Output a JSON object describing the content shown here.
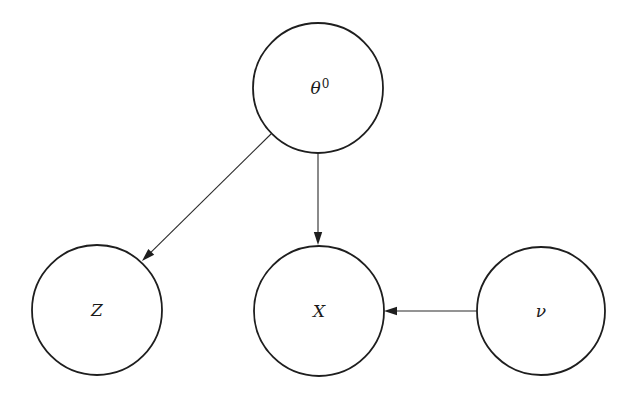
{
  "diagram": {
    "type": "directed-graph",
    "width": 635,
    "height": 398,
    "colors": {
      "background": "#ffffff",
      "stroke": "#1e1e1e",
      "text": "#1a1a1a"
    },
    "nodes": [
      {
        "id": "theta0",
        "label": "θ",
        "superscript": "0",
        "cx": 318,
        "cy": 88,
        "r": 65
      },
      {
        "id": "Z",
        "label": "Z",
        "superscript": "",
        "cx": 97,
        "cy": 310,
        "r": 65
      },
      {
        "id": "X",
        "label": "X",
        "superscript": "",
        "cx": 319,
        "cy": 311,
        "r": 65
      },
      {
        "id": "nu",
        "label": "ν",
        "superscript": "",
        "cx": 541,
        "cy": 311,
        "r": 64
      }
    ],
    "edges": [
      {
        "from": "theta0",
        "to": "Z",
        "x1": 271,
        "y1": 134,
        "x2": 142,
        "y2": 261
      },
      {
        "from": "theta0",
        "to": "X",
        "x1": 318,
        "y1": 153,
        "x2": 318,
        "y2": 245
      },
      {
        "from": "nu",
        "to": "X",
        "x1": 477,
        "y1": 311,
        "x2": 384,
        "y2": 311
      }
    ]
  }
}
